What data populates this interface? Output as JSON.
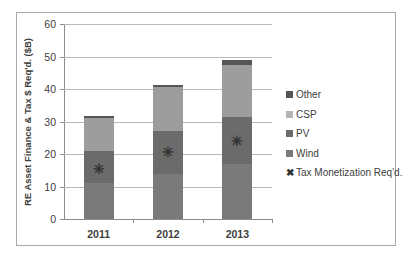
{
  "chart_data": {
    "type": "bar",
    "stacked": true,
    "title": "",
    "xlabel": "",
    "ylabel": "RE Asset Finance & Tax $ Req'd. ($B)",
    "ylim": [
      0,
      60
    ],
    "yticks": [
      "0",
      "10",
      "20",
      "30",
      "40",
      "50",
      "60"
    ],
    "grid": true,
    "legend_position": "right",
    "categories": [
      "2011",
      "2012",
      "2013"
    ],
    "series": [
      {
        "name": "Wind",
        "values": [
          11,
          14,
          17
        ],
        "color": "#7a7a7a"
      },
      {
        "name": "PV",
        "values": [
          10,
          13,
          14.5
        ],
        "color": "#6b6b6b"
      },
      {
        "name": "CSP",
        "values": [
          10,
          13.5,
          16
        ],
        "color": "#9d9d9d"
      },
      {
        "name": "Other",
        "values": [
          0.7,
          0.7,
          1.3
        ],
        "color": "#555555"
      }
    ],
    "markers": {
      "name": "Tax Monetization Req'd.",
      "symbol": "x-star",
      "values": [
        15.5,
        20.5,
        24
      ]
    }
  },
  "legend": {
    "items": [
      {
        "label": "Other",
        "color": "#555555"
      },
      {
        "label": "CSP",
        "color": "#b5b5b5"
      },
      {
        "label": "PV",
        "color": "#6b6b6b"
      },
      {
        "label": "Wind",
        "color": "#7a7a7a"
      },
      {
        "label": "Tax Monetization  Req'd.",
        "symbol": "✖"
      }
    ]
  },
  "marker_glyph": "✳"
}
